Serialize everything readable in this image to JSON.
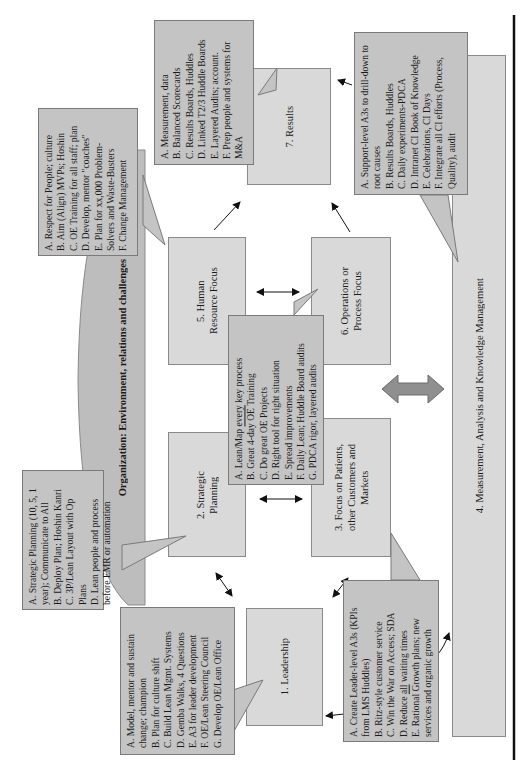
{
  "colors": {
    "box_fill": "#d9d9d9",
    "callout_fill": "#c4c4c4",
    "org_bar_fill": "#bdbdbd",
    "border": "#8a8a8a",
    "double_arrow_fill": "#8f8f8f",
    "rule": "#111111"
  },
  "organization_bar": {
    "title": "Organization: Environment, relations and challenges"
  },
  "boxes": {
    "leadership": "1. Leadership",
    "strategic_planning": "2. Strategic Planning",
    "focus_customers": "3. Focus on Patients, other Customers and Markets",
    "measurement": "4. Measurement, Analysis and Knowledge Management",
    "human_resource": "5. Human Resource Focus",
    "operations": "6. Operations or Process Focus",
    "results": "7. Results"
  },
  "callouts": {
    "leadership": [
      "A. Model, mentor and sustain change; champion",
      "B. Plan for culture shift",
      "C. Build Lean Mgmt. Systems",
      "D. Gemba Walks, 4 Questions",
      "E. A3 for leader development",
      "F. OE/Lean Steering Council",
      "G. Develop OE/Lean Office"
    ],
    "strategic_planning": [
      "A. Strategic Planning (10, 5, 1 year); Communicate to All",
      "B. Deploy Plan; Hoshin Kanri",
      "C. 3P/Lean Layout with Op Plans",
      "D. Lean people and process before EMR or automation"
    ],
    "human_resource": [
      "A. Respect for People; culture",
      "B. Aim (Align) MVPs; Hoshin",
      "C. OE Training for all staff; plan",
      "D. Develop, mentor \"coaches\"",
      "E. Plan for xx,000 Problem-Solvers and Waste-Busters",
      "F. Change Management"
    ],
    "operations": [
      "A. Lean/Map every key process",
      "B. Great 4-day OE Training",
      "C. Do great OE Projects",
      "D. Right tool for right situation",
      "E. Spread improvements",
      "F. Daily Lean; Huddle Board audits",
      "G. PDCA rigor, layered audits"
    ],
    "results": [
      "A. Measurement, data",
      "B. Balanced Scorecards",
      "C. Results Boards, Huddles",
      "D. Linked T2/3 Huddle Boards",
      "E. Layered Audits; account.",
      "F. Prep people and systems for M&A"
    ],
    "measurement": [
      "A. Support-level A3s to drill-down to root causes",
      "B. Results Boards, Huddles",
      "C. Daily experiments-PDCA",
      "D. Intranet CI Book of Knowledge",
      "E. Celebrations, CI Days",
      "F. Integrate all CI efforts (Process, Quality), audit"
    ],
    "focus_customers": [
      "A. Create Leader-level A3s (KPIs from LMS Huddles)",
      "B. Ritz-style customer service",
      "C. Win the War on Access; SDA",
      "D. Reduce all waiting times",
      "E. Rational Growth plans; new services and organic growth"
    ]
  }
}
